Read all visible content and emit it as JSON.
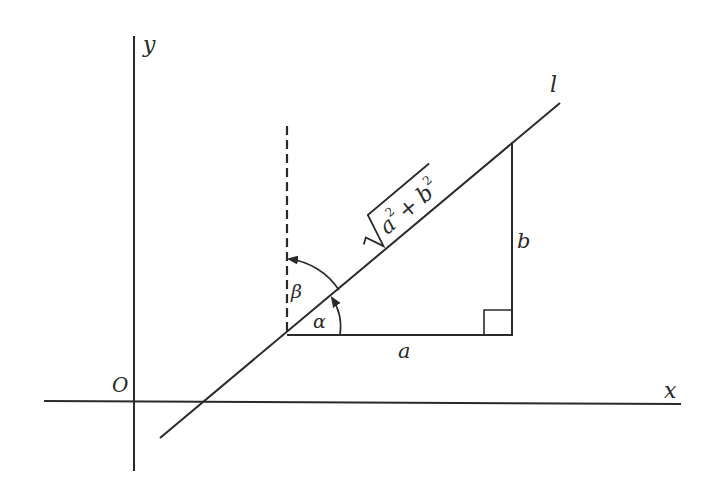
{
  "diagram": {
    "type": "geometry",
    "axes": {
      "x_label": "x",
      "y_label": "y",
      "origin_label": "O"
    },
    "line_label": "l",
    "hypotenuse_label": {
      "radical": "√",
      "a": "a",
      "plus": "+",
      "b": "b",
      "exp": "2"
    },
    "leg_horizontal_label": "a",
    "leg_vertical_label": "b",
    "angle_alpha_label": "α",
    "angle_beta_label": "β",
    "colors": {
      "stroke": "#2a2a2a",
      "background": "#ffffff"
    }
  }
}
